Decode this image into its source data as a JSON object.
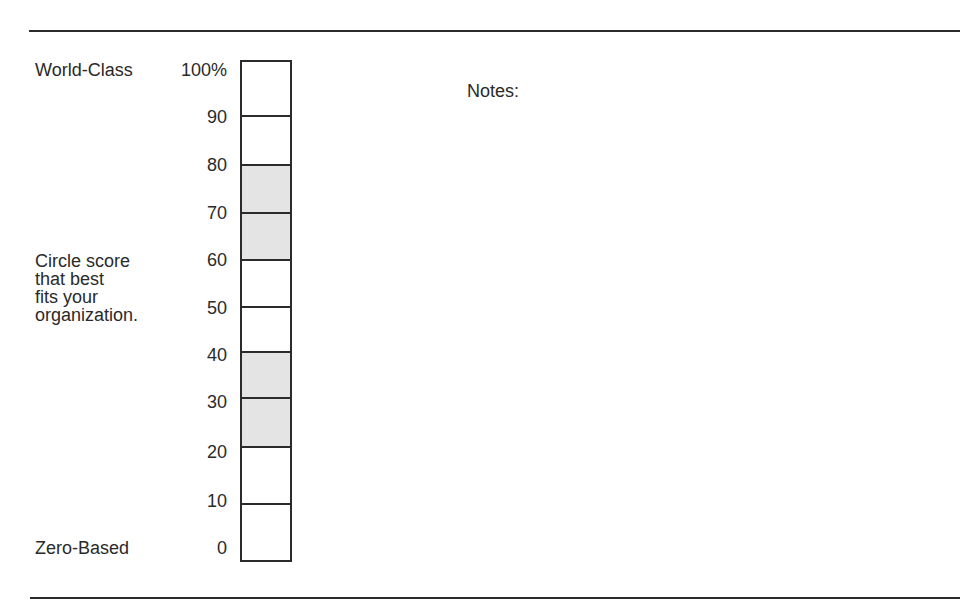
{
  "form": {
    "top_label": "World-Class",
    "bottom_label": "Zero-Based",
    "instruction_lines": [
      "Circle score",
      "that best",
      "fits your",
      "organization."
    ],
    "notes_label": "Notes:"
  },
  "scale": {
    "ticks": [
      {
        "label": "100%",
        "y": 60
      },
      {
        "label": "90",
        "y": 107
      },
      {
        "label": "80",
        "y": 155
      },
      {
        "label": "70",
        "y": 203
      },
      {
        "label": "60",
        "y": 250
      },
      {
        "label": "50",
        "y": 298
      },
      {
        "label": "40",
        "y": 345
      },
      {
        "label": "30",
        "y": 392
      },
      {
        "label": "20",
        "y": 442
      },
      {
        "label": "10",
        "y": 491
      },
      {
        "label": "0",
        "y": 538
      }
    ],
    "cells": [
      {
        "range": "90-100",
        "height": 55,
        "shaded": false
      },
      {
        "range": "80-90",
        "height": 49,
        "shaded": false
      },
      {
        "range": "70-80",
        "height": 48,
        "shaded": true
      },
      {
        "range": "60-70",
        "height": 47,
        "shaded": true
      },
      {
        "range": "50-60",
        "height": 47,
        "shaded": false
      },
      {
        "range": "40-50",
        "height": 45,
        "shaded": false
      },
      {
        "range": "30-40",
        "height": 46,
        "shaded": true
      },
      {
        "range": "20-30",
        "height": 49,
        "shaded": true
      },
      {
        "range": "10-20",
        "height": 57,
        "shaded": false
      },
      {
        "range": "0-10",
        "height": 57,
        "shaded": false
      }
    ],
    "shade_color": "#e4e4e4",
    "line_color": "#2b2b2b"
  }
}
